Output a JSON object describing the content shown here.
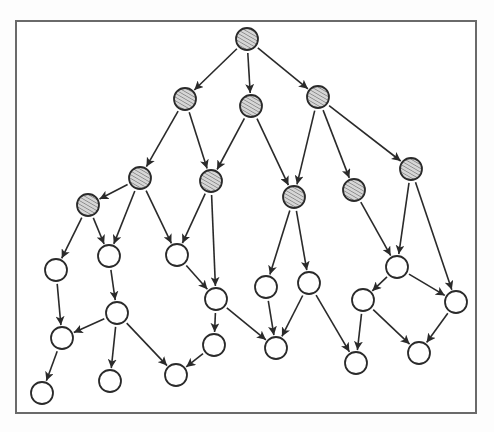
{
  "diagram": {
    "type": "directed-graph",
    "frame": {
      "x": 16,
      "y": 21,
      "width": 460,
      "height": 392,
      "stroke": "#6a6a6a"
    },
    "node_radius": 11,
    "colors": {
      "edge": "#2a2a2a",
      "node_outline": "#2a2a2a",
      "shaded_fill": "#d6d6d6",
      "hatch_line": "#7a7a7a",
      "open_fill": "#ffffff"
    },
    "legend": {
      "shaded": "hatched node",
      "open": "open node"
    },
    "nodes": [
      {
        "id": "n1",
        "x": 247,
        "y": 39,
        "style": "shaded"
      },
      {
        "id": "n2",
        "x": 185,
        "y": 99,
        "style": "shaded"
      },
      {
        "id": "n3",
        "x": 251,
        "y": 106,
        "style": "shaded"
      },
      {
        "id": "n4",
        "x": 318,
        "y": 97,
        "style": "shaded"
      },
      {
        "id": "n5",
        "x": 140,
        "y": 178,
        "style": "shaded"
      },
      {
        "id": "n6",
        "x": 211,
        "y": 181,
        "style": "shaded"
      },
      {
        "id": "n7",
        "x": 88,
        "y": 205,
        "style": "shaded"
      },
      {
        "id": "n8",
        "x": 294,
        "y": 197,
        "style": "shaded"
      },
      {
        "id": "n9",
        "x": 354,
        "y": 190,
        "style": "shaded"
      },
      {
        "id": "n10",
        "x": 411,
        "y": 169,
        "style": "shaded"
      },
      {
        "id": "n11",
        "x": 56,
        "y": 270,
        "style": "open"
      },
      {
        "id": "n12",
        "x": 109,
        "y": 256,
        "style": "open"
      },
      {
        "id": "n13",
        "x": 177,
        "y": 255,
        "style": "open"
      },
      {
        "id": "n14",
        "x": 216,
        "y": 299,
        "style": "open"
      },
      {
        "id": "n15",
        "x": 266,
        "y": 287,
        "style": "open"
      },
      {
        "id": "n16",
        "x": 309,
        "y": 283,
        "style": "open"
      },
      {
        "id": "n17",
        "x": 397,
        "y": 267,
        "style": "open"
      },
      {
        "id": "n18",
        "x": 117,
        "y": 313,
        "style": "open"
      },
      {
        "id": "n19",
        "x": 62,
        "y": 338,
        "style": "open"
      },
      {
        "id": "n20",
        "x": 214,
        "y": 345,
        "style": "open"
      },
      {
        "id": "n21",
        "x": 276,
        "y": 348,
        "style": "open"
      },
      {
        "id": "n22",
        "x": 363,
        "y": 300,
        "style": "open"
      },
      {
        "id": "n23",
        "x": 456,
        "y": 302,
        "style": "open"
      },
      {
        "id": "n24",
        "x": 42,
        "y": 393,
        "style": "open"
      },
      {
        "id": "n25",
        "x": 110,
        "y": 381,
        "style": "open"
      },
      {
        "id": "n26",
        "x": 176,
        "y": 375,
        "style": "open"
      },
      {
        "id": "n27",
        "x": 356,
        "y": 363,
        "style": "open"
      },
      {
        "id": "n28",
        "x": 419,
        "y": 353,
        "style": "open"
      }
    ],
    "edges": [
      [
        "n1",
        "n2"
      ],
      [
        "n1",
        "n3"
      ],
      [
        "n1",
        "n4"
      ],
      [
        "n2",
        "n5"
      ],
      [
        "n2",
        "n6"
      ],
      [
        "n3",
        "n6"
      ],
      [
        "n3",
        "n8"
      ],
      [
        "n4",
        "n8"
      ],
      [
        "n4",
        "n9"
      ],
      [
        "n4",
        "n10"
      ],
      [
        "n5",
        "n7"
      ],
      [
        "n5",
        "n12"
      ],
      [
        "n5",
        "n13"
      ],
      [
        "n7",
        "n11"
      ],
      [
        "n7",
        "n12"
      ],
      [
        "n6",
        "n13"
      ],
      [
        "n6",
        "n14"
      ],
      [
        "n8",
        "n15"
      ],
      [
        "n8",
        "n16"
      ],
      [
        "n9",
        "n17"
      ],
      [
        "n10",
        "n17"
      ],
      [
        "n10",
        "n23"
      ],
      [
        "n11",
        "n19"
      ],
      [
        "n12",
        "n18"
      ],
      [
        "n18",
        "n19"
      ],
      [
        "n18",
        "n25"
      ],
      [
        "n18",
        "n26"
      ],
      [
        "n19",
        "n24"
      ],
      [
        "n13",
        "n14"
      ],
      [
        "n14",
        "n20"
      ],
      [
        "n14",
        "n21"
      ],
      [
        "n20",
        "n26"
      ],
      [
        "n15",
        "n21"
      ],
      [
        "n16",
        "n21"
      ],
      [
        "n16",
        "n27"
      ],
      [
        "n17",
        "n22"
      ],
      [
        "n17",
        "n23"
      ],
      [
        "n22",
        "n27"
      ],
      [
        "n22",
        "n28"
      ],
      [
        "n23",
        "n28"
      ]
    ],
    "counts": {
      "nodes": 28,
      "shaded_nodes": 10,
      "open_nodes": 18,
      "edges": 40
    }
  }
}
